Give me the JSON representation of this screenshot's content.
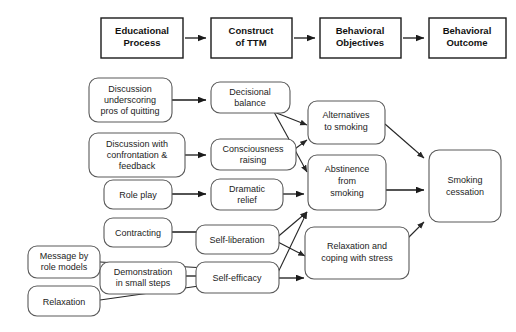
{
  "diagram": {
    "colors": {
      "background": "#ffffff",
      "header_border": "#1a1a1a",
      "node_border": "#5a5a5a",
      "arrow": "#1a1a1a",
      "text": "#1c1c1c"
    },
    "headers": [
      {
        "id": "educational-process",
        "line1": "Educational",
        "line2": "Process"
      },
      {
        "id": "construct-of-ttm",
        "line1": "Construct",
        "line2": "of TTM"
      },
      {
        "id": "behavioral-objectives",
        "line1": "Behavioral",
        "line2": "Objectives"
      },
      {
        "id": "behavioral-outcome",
        "line1": "Behavioral",
        "line2": "Outcome"
      }
    ],
    "column1": [
      {
        "id": "discussion-pros",
        "line1": "Discussion",
        "line2": "underscoring",
        "line3": "pros of quitting"
      },
      {
        "id": "discussion-confrontation",
        "line1": "Discussion with",
        "line2": "confrontation &",
        "line3": "feedback"
      },
      {
        "id": "role-play",
        "line1": "Role play",
        "line2": "",
        "line3": ""
      },
      {
        "id": "contracting",
        "line1": "Contracting",
        "line2": "",
        "line3": ""
      },
      {
        "id": "message-role-models",
        "line1": "Message by",
        "line2": "role models",
        "line3": ""
      },
      {
        "id": "demonstration-small-steps",
        "line1": "Demonstration",
        "line2": "in small steps",
        "line3": ""
      },
      {
        "id": "relaxation",
        "line1": "Relaxation",
        "line2": "",
        "line3": ""
      }
    ],
    "column2": [
      {
        "id": "decisional-balance",
        "line1": "Decisional",
        "line2": "balance"
      },
      {
        "id": "consciousness-raising",
        "line1": "Consciousness",
        "line2": "raising"
      },
      {
        "id": "dramatic-relief",
        "line1": "Dramatic",
        "line2": "relief"
      },
      {
        "id": "self-liberation",
        "line1": "Self-liberation",
        "line2": ""
      },
      {
        "id": "self-efficacy",
        "line1": "Self-efficacy",
        "line2": ""
      }
    ],
    "column3": [
      {
        "id": "alternatives-to-smoking",
        "line1": "Alternatives",
        "line2": "to smoking"
      },
      {
        "id": "abstinence-from-smoking",
        "line1": "Abstinence",
        "line2": "from",
        "line3": "smoking"
      },
      {
        "id": "relaxation-coping",
        "line1": "Relaxation and",
        "line2": "coping with stress"
      }
    ],
    "column4": [
      {
        "id": "smoking-cessation",
        "line1": "Smoking",
        "line2": "cessation"
      }
    ],
    "connections": [
      {
        "from": "educational-process",
        "to": "construct-of-ttm"
      },
      {
        "from": "construct-of-ttm",
        "to": "behavioral-objectives"
      },
      {
        "from": "behavioral-objectives",
        "to": "behavioral-outcome"
      },
      {
        "from": "discussion-pros",
        "to": "decisional-balance"
      },
      {
        "from": "discussion-confrontation",
        "to": "consciousness-raising"
      },
      {
        "from": "role-play",
        "to": "dramatic-relief"
      },
      {
        "from": "contracting",
        "to": "self-liberation"
      },
      {
        "from": "message-role-models",
        "to": "self-efficacy"
      },
      {
        "from": "demonstration-small-steps",
        "to": "self-efficacy"
      },
      {
        "from": "relaxation",
        "to": "self-efficacy"
      },
      {
        "from": "decisional-balance",
        "to": "alternatives-to-smoking"
      },
      {
        "from": "decisional-balance",
        "to": "abstinence-from-smoking"
      },
      {
        "from": "consciousness-raising",
        "to": "alternatives-to-smoking"
      },
      {
        "from": "dramatic-relief",
        "to": "abstinence-from-smoking"
      },
      {
        "from": "self-liberation",
        "to": "abstinence-from-smoking"
      },
      {
        "from": "self-liberation",
        "to": "relaxation-coping"
      },
      {
        "from": "self-efficacy",
        "to": "abstinence-from-smoking"
      },
      {
        "from": "self-efficacy",
        "to": "relaxation-coping"
      },
      {
        "from": "alternatives-to-smoking",
        "to": "smoking-cessation"
      },
      {
        "from": "abstinence-from-smoking",
        "to": "smoking-cessation"
      },
      {
        "from": "relaxation-coping",
        "to": "smoking-cessation"
      }
    ]
  }
}
